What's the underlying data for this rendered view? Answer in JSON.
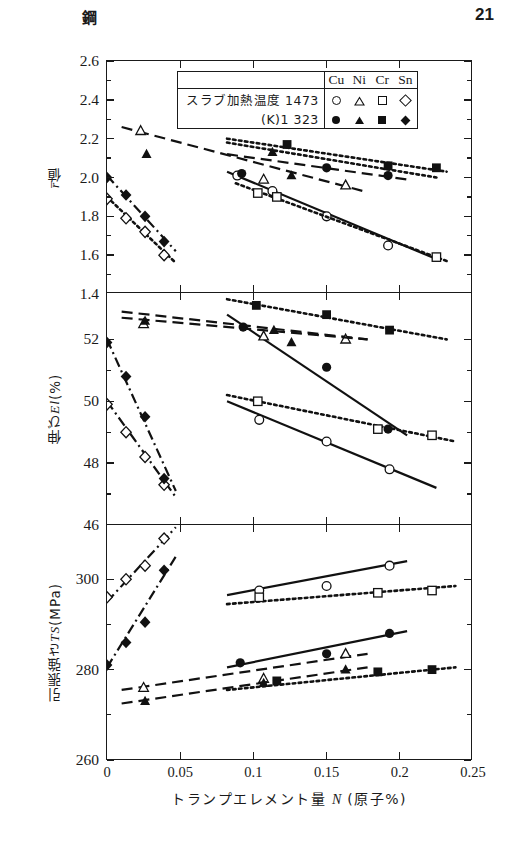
{
  "header": {
    "kanji": "鋼",
    "page_number": "21"
  },
  "legend": {
    "row1_label": "スラブ加熱温度 1473",
    "row2_label": "(K)1 323",
    "elements": [
      "Cu",
      "Ni",
      "Cr",
      "Sn"
    ],
    "open_markers": [
      "circle-open",
      "triangle-open",
      "square-open",
      "diamond-open"
    ],
    "filled_markers": [
      "circle-filled",
      "triangle-filled",
      "square-filled",
      "diamond-filled"
    ]
  },
  "axis": {
    "x_title_pre": "トランプエレメント量 ",
    "x_title_sym": "N",
    "x_title_post": " (原子%)",
    "x_ticks": [
      "0",
      "0.05",
      "0.1",
      "0.15",
      "0.2",
      "0.25"
    ],
    "x_tick_values": [
      0,
      0.05,
      0.1,
      0.15,
      0.2,
      0.25
    ],
    "x_min": 0,
    "x_max": 0.25
  },
  "chart_data": [
    {
      "type": "scatter",
      "panel": 1,
      "title": "",
      "ylabel": "r̄値",
      "ylabel_sym": "r",
      "ylabel_suffix": "値",
      "xlabel": "トランプエレメント量 N (原子%)",
      "ylim": [
        1.4,
        2.6
      ],
      "xlim": [
        0,
        0.25
      ],
      "y_ticks": [
        "1.4",
        "1.6",
        "1.8",
        "2.0",
        "2.2",
        "2.4",
        "2.6"
      ],
      "y_tick_values": [
        1.4,
        1.6,
        1.8,
        2.0,
        2.2,
        2.4,
        2.6
      ],
      "grid": false,
      "legend_position": "top-center",
      "series": [
        {
          "name": "Cu 1473",
          "marker": "circle-open",
          "line": "solid",
          "x": [
            0.089,
            0.113,
            0.15,
            0.192
          ],
          "y": [
            2.01,
            1.93,
            1.8,
            1.65
          ],
          "fit": [
            [
              0.082,
              2.03
            ],
            [
              0.225,
              1.58
            ]
          ]
        },
        {
          "name": "Cu 1323",
          "marker": "circle-filled",
          "line": "dashed",
          "x": [
            0.092,
            0.15,
            0.192
          ],
          "y": [
            2.02,
            2.05,
            2.01
          ],
          "fit": [
            [
              0.082,
              2.12
            ],
            [
              0.205,
              1.99
            ]
          ]
        },
        {
          "name": "Ni 1473",
          "marker": "triangle-open",
          "line": "dashed",
          "x": [
            0.023,
            0.107,
            0.163
          ],
          "y": [
            2.24,
            1.99,
            1.96
          ],
          "fit": [
            [
              0.01,
              2.26
            ],
            [
              0.175,
              1.93
            ]
          ]
        },
        {
          "name": "Ni 1323",
          "marker": "triangle-filled",
          "line": "dotted",
          "x": [
            0.027,
            0.113,
            0.126
          ],
          "y": [
            2.12,
            2.13,
            2.01
          ],
          "fit": [
            [
              0.082,
              2.18
            ],
            [
              0.225,
              2.0
            ]
          ]
        },
        {
          "name": "Cr 1473",
          "marker": "square-open",
          "line": "dotted",
          "x": [
            0.103,
            0.116,
            0.225
          ],
          "y": [
            1.92,
            1.9,
            1.59
          ],
          "fit": [
            [
              0.088,
              1.97
            ],
            [
              0.232,
              1.57
            ]
          ]
        },
        {
          "name": "Cr 1323",
          "marker": "square-filled",
          "line": "dotted",
          "x": [
            0.123,
            0.192,
            0.225
          ],
          "y": [
            2.17,
            2.06,
            2.05
          ],
          "fit": [
            [
              0.082,
              2.2
            ],
            [
              0.232,
              2.03
            ]
          ]
        },
        {
          "name": "Sn 1473",
          "marker": "diamond-open",
          "line": "dotted",
          "x": [
            0.0,
            0.013,
            0.026,
            0.039
          ],
          "y": [
            1.89,
            1.79,
            1.72,
            1.6
          ],
          "fit": [
            [
              0.0,
              1.9
            ],
            [
              0.047,
              1.56
            ]
          ]
        },
        {
          "name": "Sn 1323",
          "marker": "diamond-filled",
          "line": "dashdot",
          "x": [
            0.0,
            0.013,
            0.026,
            0.039
          ],
          "y": [
            2.0,
            1.91,
            1.8,
            1.67
          ],
          "fit": [
            [
              0.0,
              2.01
            ],
            [
              0.047,
              1.62
            ]
          ]
        }
      ]
    },
    {
      "type": "scatter",
      "panel": 2,
      "title": "",
      "ylabel": "伸び El (%)",
      "ylabel_sym": "El",
      "xlabel": "トランプエレメント量 N (原子%)",
      "ylim": [
        46,
        53.5
      ],
      "xlim": [
        0,
        0.25
      ],
      "y_ticks": [
        "46",
        "48",
        "50",
        "52"
      ],
      "y_tick_values": [
        46,
        48,
        50,
        52
      ],
      "grid": false,
      "legend_position": "none",
      "series": [
        {
          "name": "Cu 1473",
          "marker": "circle-open",
          "line": "solid",
          "x": [
            0.104,
            0.15,
            0.193
          ],
          "y": [
            49.4,
            48.7,
            47.8
          ],
          "fit": [
            [
              0.082,
              50.0
            ],
            [
              0.225,
              47.2
            ]
          ]
        },
        {
          "name": "Cu 1323",
          "marker": "circle-filled",
          "line": "solid",
          "x": [
            0.093,
            0.15,
            0.192
          ],
          "y": [
            52.4,
            51.1,
            49.1
          ],
          "fit": [
            [
              0.082,
              52.8
            ],
            [
              0.205,
              48.9
            ]
          ]
        },
        {
          "name": "Ni 1473",
          "marker": "triangle-open",
          "line": "dashed",
          "x": [
            0.025,
            0.107,
            0.163
          ],
          "y": [
            52.5,
            52.1,
            52.0
          ],
          "fit": [
            [
              0.01,
              52.9
            ],
            [
              0.178,
              52.0
            ]
          ]
        },
        {
          "name": "Ni 1323",
          "marker": "triangle-filled",
          "line": "dashed",
          "x": [
            0.026,
            0.114,
            0.126
          ],
          "y": [
            52.6,
            52.3,
            51.9
          ],
          "fit": [
            [
              0.01,
              52.7
            ],
            [
              0.178,
              52.0
            ]
          ]
        },
        {
          "name": "Cr 1473",
          "marker": "square-open",
          "line": "dotted",
          "x": [
            0.103,
            0.185,
            0.222
          ],
          "y": [
            50.0,
            49.1,
            48.9
          ],
          "fit": [
            [
              0.082,
              50.2
            ],
            [
              0.238,
              48.7
            ]
          ]
        },
        {
          "name": "Cr 1323",
          "marker": "square-filled",
          "line": "dotted",
          "x": [
            0.102,
            0.15,
            0.193
          ],
          "y": [
            53.1,
            52.8,
            52.3
          ],
          "fit": [
            [
              0.082,
              53.3
            ],
            [
              0.232,
              52.0
            ]
          ]
        },
        {
          "name": "Sn 1473",
          "marker": "diamond-open",
          "line": "dashdot",
          "x": [
            0.0,
            0.013,
            0.026,
            0.039
          ],
          "y": [
            49.9,
            49.0,
            48.2,
            47.3
          ],
          "fit": [
            [
              0.0,
              50.0
            ],
            [
              0.047,
              46.9
            ]
          ]
        },
        {
          "name": "Sn 1323",
          "marker": "diamond-filled",
          "line": "dashdot",
          "x": [
            0.0,
            0.013,
            0.026,
            0.039
          ],
          "y": [
            51.9,
            50.8,
            49.5,
            47.5
          ],
          "fit": [
            [
              0.0,
              52.0
            ],
            [
              0.047,
              47.1
            ]
          ]
        }
      ]
    },
    {
      "type": "scatter",
      "panel": 3,
      "title": "",
      "ylabel": "引張強さ TS(MPa)",
      "ylabel_sym": "TS",
      "xlabel": "トランプエレメント量 N (原子%)",
      "ylim": [
        260,
        312
      ],
      "xlim": [
        0,
        0.25
      ],
      "y_ticks": [
        "260",
        "280",
        "300"
      ],
      "y_tick_values": [
        260,
        280,
        300
      ],
      "grid": false,
      "legend_position": "none",
      "series": [
        {
          "name": "Cu 1473",
          "marker": "circle-open",
          "line": "solid",
          "x": [
            0.104,
            0.15,
            0.193
          ],
          "y": [
            297.5,
            298.5,
            303.0
          ],
          "fit": [
            [
              0.082,
              296.5
            ],
            [
              0.205,
              304.0
            ]
          ]
        },
        {
          "name": "Cu 1323",
          "marker": "circle-filled",
          "line": "solid",
          "x": [
            0.091,
            0.15,
            0.193
          ],
          "y": [
            281.5,
            283.5,
            288.0
          ],
          "fit": [
            [
              0.082,
              280.5
            ],
            [
              0.205,
              288.5
            ]
          ]
        },
        {
          "name": "Ni 1473",
          "marker": "triangle-open",
          "line": "dashed",
          "x": [
            0.025,
            0.107,
            0.163
          ],
          "y": [
            276.0,
            278.0,
            283.5
          ],
          "fit": [
            [
              0.01,
              275.5
            ],
            [
              0.178,
              283.5
            ]
          ]
        },
        {
          "name": "Ni 1323",
          "marker": "triangle-filled",
          "line": "dashed",
          "x": [
            0.026,
            0.107,
            0.163
          ],
          "y": [
            273.0,
            277.0,
            280.0
          ],
          "fit": [
            [
              0.01,
              272.5
            ],
            [
              0.178,
              280.5
            ]
          ]
        },
        {
          "name": "Cr 1473",
          "marker": "square-open",
          "line": "dotted",
          "x": [
            0.104,
            0.185,
            0.222
          ],
          "y": [
            296.0,
            297.0,
            297.5
          ],
          "fit": [
            [
              0.082,
              294.5
            ],
            [
              0.238,
              298.5
            ]
          ]
        },
        {
          "name": "Cr 1323",
          "marker": "square-filled",
          "line": "dotted",
          "x": [
            0.116,
            0.185,
            0.222
          ],
          "y": [
            277.5,
            279.5,
            280.0
          ],
          "fit": [
            [
              0.082,
              275.5
            ],
            [
              0.238,
              280.5
            ]
          ]
        },
        {
          "name": "Sn 1473",
          "marker": "diamond-open",
          "line": "dashdot",
          "x": [
            0.0,
            0.013,
            0.026,
            0.039
          ],
          "y": [
            296.0,
            300.0,
            303.0,
            309.0
          ],
          "fit": [
            [
              0.0,
              295.0
            ],
            [
              0.047,
              311.5
            ]
          ]
        },
        {
          "name": "Sn 1323",
          "marker": "diamond-filled",
          "line": "dashdot",
          "x": [
            0.0,
            0.013,
            0.026,
            0.039
          ],
          "y": [
            281.0,
            286.0,
            290.5,
            302.0
          ],
          "fit": [
            [
              0.0,
              280.5
            ],
            [
              0.047,
              305.0
            ]
          ]
        }
      ]
    }
  ]
}
